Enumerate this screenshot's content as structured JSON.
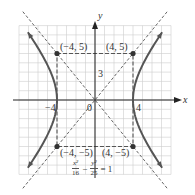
{
  "chart_data": {
    "type": "line",
    "title": "",
    "equation": {
      "lhs_term1_num": "x²",
      "lhs_term1_den": "16",
      "operator": "−",
      "lhs_term2_num": "y²",
      "lhs_term2_den": "25",
      "rhs": "= 1"
    },
    "xlabel": "x",
    "ylabel": "y",
    "xlim": [
      -8,
      8
    ],
    "ylim": [
      -8,
      8
    ],
    "grid": true,
    "tick_labels": {
      "x": [
        {
          "value": -4,
          "label": "−4"
        },
        {
          "value": 4,
          "label": "4"
        }
      ],
      "y": [
        {
          "value": 3,
          "label": "3"
        }
      ],
      "origin": "0"
    },
    "points": [
      {
        "x": -4,
        "y": 5,
        "label": "(−4, 5)"
      },
      {
        "x": 4,
        "y": 5,
        "label": "(4, 5)"
      },
      {
        "x": -4,
        "y": -5,
        "label": "(−4, −5)"
      },
      {
        "x": 4,
        "y": -5,
        "label": "(4, −5)"
      }
    ],
    "series": [
      {
        "name": "hyperbola right branch",
        "style": "solid",
        "a": 4,
        "b": 5,
        "branch": "right"
      },
      {
        "name": "hyperbola left branch",
        "style": "solid",
        "a": 4,
        "b": 5,
        "branch": "left"
      },
      {
        "name": "asymptote y = 5x/4",
        "style": "dashed",
        "slope": 1.25
      },
      {
        "name": "asymptote y = -5x/4",
        "style": "dashed",
        "slope": -1.25
      },
      {
        "name": "fundamental rectangle",
        "style": "dashed",
        "corners": [
          [
            -4,
            5
          ],
          [
            4,
            5
          ],
          [
            4,
            -5
          ],
          [
            -4,
            -5
          ]
        ]
      }
    ],
    "colors": {
      "curve": "#555555",
      "axis": "#222222",
      "grid": "#cccccc",
      "dashed": "#555555",
      "point": "#333333"
    }
  }
}
